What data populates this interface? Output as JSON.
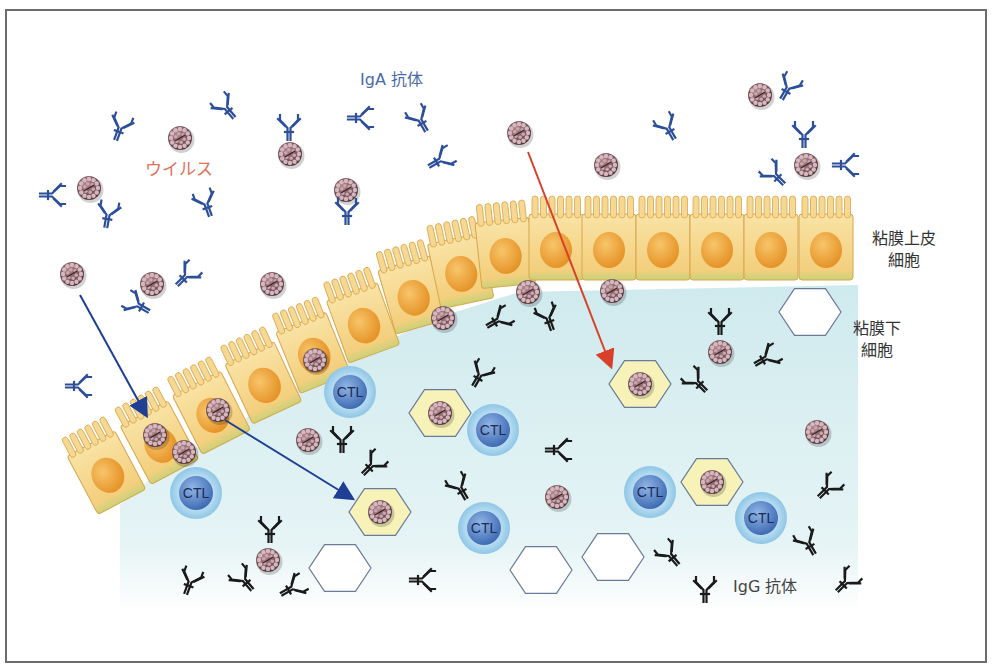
{
  "labels": {
    "iga_antibody": "IgA 抗体",
    "virus": "ウイルス",
    "mucosal_epithelial_line1": "粘膜上皮",
    "mucosal_epithelial_line2": "細胞",
    "submucosal_line1": "粘膜下",
    "submucosal_line2": "細胞",
    "igg_antibody": "IgG 抗体",
    "ctl": "CTL"
  },
  "colors": {
    "frame": "#6b6b6b",
    "submucosa_fill": "#dff1f3",
    "cell_fill": "#f6d892",
    "cell_edge": "#d8a64a",
    "nucleus": "#f0a53a",
    "iga_color": "#2d4f9a",
    "igg_color": "#1a1a1a",
    "virus_color": "#6b4a4e",
    "ctl_outer": "#a9d4ec",
    "ctl_inner": "#4f7fc0",
    "hexagon_infected": "#f6f2b8",
    "blue_arrow": "#1f3f95",
    "red_arrow": "#d9402a"
  },
  "diagram": {
    "ctl_cells": [
      {
        "x": 196,
        "y": 493
      },
      {
        "x": 350,
        "y": 392
      },
      {
        "x": 493,
        "y": 430
      },
      {
        "x": 484,
        "y": 528
      },
      {
        "x": 650,
        "y": 492
      },
      {
        "x": 761,
        "y": 518
      }
    ],
    "infected_cells": [
      {
        "x": 380,
        "y": 512
      },
      {
        "x": 440,
        "y": 413
      },
      {
        "x": 640,
        "y": 384
      },
      {
        "x": 712,
        "y": 482
      }
    ],
    "empty_cells": [
      {
        "x": 340,
        "y": 568
      },
      {
        "x": 541,
        "y": 570
      },
      {
        "x": 613,
        "y": 557
      },
      {
        "x": 810,
        "y": 312
      }
    ],
    "viruses": [
      {
        "x": 180,
        "y": 138
      },
      {
        "x": 89,
        "y": 188
      },
      {
        "x": 290,
        "y": 154
      },
      {
        "x": 346,
        "y": 190
      },
      {
        "x": 72,
        "y": 274
      },
      {
        "x": 152,
        "y": 284
      },
      {
        "x": 272,
        "y": 284
      },
      {
        "x": 519,
        "y": 133
      },
      {
        "x": 606,
        "y": 165
      },
      {
        "x": 760,
        "y": 95
      },
      {
        "x": 806,
        "y": 165
      },
      {
        "x": 528,
        "y": 292
      },
      {
        "x": 612,
        "y": 291
      },
      {
        "x": 443,
        "y": 318
      },
      {
        "x": 315,
        "y": 360
      },
      {
        "x": 720,
        "y": 352
      },
      {
        "x": 218,
        "y": 410
      },
      {
        "x": 155,
        "y": 435
      },
      {
        "x": 184,
        "y": 452
      },
      {
        "x": 308,
        "y": 440
      },
      {
        "x": 817,
        "y": 432
      },
      {
        "x": 557,
        "y": 497
      },
      {
        "x": 268,
        "y": 560
      }
    ],
    "iga_antibodies": [
      {
        "x": 120,
        "y": 128,
        "r": 20
      },
      {
        "x": 226,
        "y": 108,
        "r": -40
      },
      {
        "x": 289,
        "y": 128,
        "r": 0
      },
      {
        "x": 360,
        "y": 118,
        "r": 90
      },
      {
        "x": 420,
        "y": 120,
        "r": -30
      },
      {
        "x": 440,
        "y": 160,
        "r": 60
      },
      {
        "x": 52,
        "y": 195,
        "r": 90
      },
      {
        "x": 108,
        "y": 215,
        "r": 10
      },
      {
        "x": 206,
        "y": 204,
        "r": -20
      },
      {
        "x": 347,
        "y": 212,
        "r": 0
      },
      {
        "x": 186,
        "y": 276,
        "r": 45
      },
      {
        "x": 138,
        "y": 305,
        "r": -60
      },
      {
        "x": 78,
        "y": 386,
        "r": 90
      },
      {
        "x": 668,
        "y": 128,
        "r": -30
      },
      {
        "x": 788,
        "y": 88,
        "r": 30
      },
      {
        "x": 804,
        "y": 135,
        "r": 0
      },
      {
        "x": 845,
        "y": 165,
        "r": 90
      },
      {
        "x": 775,
        "y": 175,
        "r": -45
      }
    ],
    "igg_antibodies": [
      {
        "x": 498,
        "y": 320,
        "r": 60
      },
      {
        "x": 548,
        "y": 318,
        "r": -20
      },
      {
        "x": 480,
        "y": 375,
        "r": 30
      },
      {
        "x": 342,
        "y": 440,
        "r": 0
      },
      {
        "x": 372,
        "y": 465,
        "r": 45
      },
      {
        "x": 460,
        "y": 488,
        "r": -30
      },
      {
        "x": 558,
        "y": 450,
        "r": 90
      },
      {
        "x": 720,
        "y": 322,
        "r": 0
      },
      {
        "x": 766,
        "y": 358,
        "r": 60
      },
      {
        "x": 697,
        "y": 382,
        "r": -45
      },
      {
        "x": 828,
        "y": 488,
        "r": 45
      },
      {
        "x": 808,
        "y": 543,
        "r": -30
      },
      {
        "x": 270,
        "y": 530,
        "r": 0
      },
      {
        "x": 190,
        "y": 582,
        "r": 20
      },
      {
        "x": 244,
        "y": 580,
        "r": -40
      },
      {
        "x": 292,
        "y": 588,
        "r": 60
      },
      {
        "x": 422,
        "y": 580,
        "r": 90
      },
      {
        "x": 670,
        "y": 555,
        "r": -40
      },
      {
        "x": 705,
        "y": 590,
        "r": 0
      },
      {
        "x": 846,
        "y": 582,
        "r": 45
      }
    ],
    "arrows": [
      {
        "type": "blue",
        "x1": 80,
        "y1": 295,
        "x2": 145,
        "y2": 413
      },
      {
        "type": "blue",
        "x1": 225,
        "y1": 420,
        "x2": 350,
        "y2": 497
      },
      {
        "type": "red",
        "x1": 528,
        "y1": 152,
        "x2": 610,
        "y2": 364
      }
    ]
  }
}
